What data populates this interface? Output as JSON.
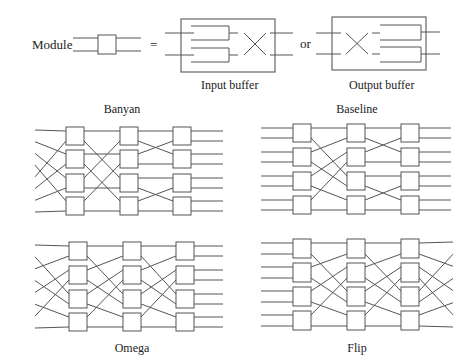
{
  "legend": {
    "module_label": "Module",
    "equals": "=",
    "or": "or",
    "input_buffer_label": "Input buffer",
    "output_buffer_label": "Output buffer"
  },
  "networks": [
    {
      "id": "banyan",
      "title": "Banyan",
      "title_pos": [
        122,
        113
      ],
      "stage_x": [
        66,
        120,
        173
      ],
      "box_w": 18,
      "box_h": 18,
      "rows_y": [
        127,
        150,
        174,
        197
      ],
      "in_x": 35,
      "out_x": 223,
      "inputs": [
        [
          0,
          0
        ],
        [
          1,
          0
        ],
        [
          2,
          0
        ],
        [
          3,
          0
        ],
        [
          0,
          1
        ],
        [
          1,
          1
        ],
        [
          2,
          1
        ],
        [
          3,
          1
        ]
      ],
      "links": [
        [
          [
            0,
            0
          ],
          [
            0,
            0
          ]
        ],
        [
          [
            0,
            1
          ],
          [
            2,
            0
          ]
        ],
        [
          [
            1,
            0
          ],
          [
            1,
            0
          ]
        ],
        [
          [
            1,
            1
          ],
          [
            3,
            0
          ]
        ],
        [
          [
            2,
            0
          ],
          [
            0,
            1
          ]
        ],
        [
          [
            2,
            1
          ],
          [
            2,
            1
          ]
        ],
        [
          [
            3,
            0
          ],
          [
            1,
            1
          ]
        ],
        [
          [
            3,
            1
          ],
          [
            3,
            1
          ]
        ]
      ],
      "links2": [
        [
          [
            0,
            0
          ],
          [
            0,
            0
          ]
        ],
        [
          [
            0,
            1
          ],
          [
            1,
            0
          ]
        ],
        [
          [
            1,
            0
          ],
          [
            0,
            1
          ]
        ],
        [
          [
            1,
            1
          ],
          [
            1,
            1
          ]
        ],
        [
          [
            2,
            0
          ],
          [
            2,
            0
          ]
        ],
        [
          [
            2,
            1
          ],
          [
            3,
            0
          ]
        ],
        [
          [
            3,
            0
          ],
          [
            2,
            1
          ]
        ],
        [
          [
            3,
            1
          ],
          [
            3,
            1
          ]
        ]
      ],
      "output_mode": "parallel"
    },
    {
      "id": "baseline",
      "title": "Baseline",
      "title_pos": [
        357,
        113
      ],
      "stage_x": [
        293,
        347,
        401
      ],
      "box_w": 18,
      "box_h": 18,
      "rows_y": [
        124,
        148,
        172,
        196
      ],
      "in_x": 261,
      "out_x": 451,
      "input_mode": "parallel",
      "links": [
        [
          [
            0,
            0
          ],
          [
            0,
            0
          ]
        ],
        [
          [
            0,
            1
          ],
          [
            2,
            0
          ]
        ],
        [
          [
            1,
            0
          ],
          [
            0,
            1
          ]
        ],
        [
          [
            1,
            1
          ],
          [
            2,
            1
          ]
        ],
        [
          [
            2,
            0
          ],
          [
            1,
            0
          ]
        ],
        [
          [
            2,
            1
          ],
          [
            3,
            0
          ]
        ],
        [
          [
            3,
            0
          ],
          [
            1,
            1
          ]
        ],
        [
          [
            3,
            1
          ],
          [
            3,
            1
          ]
        ]
      ],
      "links2": [
        [
          [
            0,
            0
          ],
          [
            0,
            0
          ]
        ],
        [
          [
            0,
            1
          ],
          [
            1,
            0
          ]
        ],
        [
          [
            1,
            0
          ],
          [
            0,
            1
          ]
        ],
        [
          [
            1,
            1
          ],
          [
            1,
            1
          ]
        ],
        [
          [
            2,
            0
          ],
          [
            2,
            0
          ]
        ],
        [
          [
            2,
            1
          ],
          [
            3,
            0
          ]
        ],
        [
          [
            3,
            0
          ],
          [
            2,
            1
          ]
        ],
        [
          [
            3,
            1
          ],
          [
            3,
            1
          ]
        ]
      ],
      "output_mode": "parallel"
    },
    {
      "id": "omega",
      "title": "Omega",
      "title_pos": [
        132,
        352
      ],
      "stage_x": [
        69,
        123,
        176
      ],
      "box_w": 18,
      "box_h": 18,
      "rows_y": [
        242,
        266,
        290,
        313
      ],
      "in_x": 35,
      "out_x": 223,
      "inputs": [
        [
          0,
          0
        ],
        [
          2,
          0
        ],
        [
          0,
          1
        ],
        [
          2,
          1
        ],
        [
          1,
          0
        ],
        [
          3,
          0
        ],
        [
          1,
          1
        ],
        [
          3,
          1
        ]
      ],
      "links": [
        [
          [
            0,
            0
          ],
          [
            0,
            0
          ]
        ],
        [
          [
            0,
            1
          ],
          [
            2,
            0
          ]
        ],
        [
          [
            1,
            0
          ],
          [
            0,
            1
          ]
        ],
        [
          [
            1,
            1
          ],
          [
            2,
            1
          ]
        ],
        [
          [
            2,
            0
          ],
          [
            1,
            0
          ]
        ],
        [
          [
            2,
            1
          ],
          [
            3,
            0
          ]
        ],
        [
          [
            3,
            0
          ],
          [
            1,
            1
          ]
        ],
        [
          [
            3,
            1
          ],
          [
            3,
            1
          ]
        ]
      ],
      "links2": [
        [
          [
            0,
            0
          ],
          [
            0,
            0
          ]
        ],
        [
          [
            0,
            1
          ],
          [
            2,
            0
          ]
        ],
        [
          [
            1,
            0
          ],
          [
            0,
            1
          ]
        ],
        [
          [
            1,
            1
          ],
          [
            2,
            1
          ]
        ],
        [
          [
            2,
            0
          ],
          [
            1,
            0
          ]
        ],
        [
          [
            2,
            1
          ],
          [
            3,
            0
          ]
        ],
        [
          [
            3,
            0
          ],
          [
            1,
            1
          ]
        ],
        [
          [
            3,
            1
          ],
          [
            3,
            1
          ]
        ]
      ],
      "output_mode": "parallel"
    },
    {
      "id": "flip",
      "title": "Flip",
      "title_pos": [
        357,
        352
      ],
      "stage_x": [
        293,
        347,
        401
      ],
      "box_w": 18,
      "box_h": 19,
      "rows_y": [
        239,
        263,
        287,
        311
      ],
      "in_x": 261,
      "out_x": 453,
      "input_mode": "parallel",
      "links": [
        [
          [
            0,
            0
          ],
          [
            0,
            0
          ]
        ],
        [
          [
            0,
            1
          ],
          [
            2,
            0
          ]
        ],
        [
          [
            1,
            0
          ],
          [
            0,
            1
          ]
        ],
        [
          [
            1,
            1
          ],
          [
            2,
            1
          ]
        ],
        [
          [
            2,
            0
          ],
          [
            1,
            0
          ]
        ],
        [
          [
            2,
            1
          ],
          [
            3,
            0
          ]
        ],
        [
          [
            3,
            0
          ],
          [
            1,
            1
          ]
        ],
        [
          [
            3,
            1
          ],
          [
            3,
            1
          ]
        ]
      ],
      "links2": [
        [
          [
            0,
            0
          ],
          [
            0,
            0
          ]
        ],
        [
          [
            0,
            1
          ],
          [
            2,
            0
          ]
        ],
        [
          [
            1,
            0
          ],
          [
            0,
            1
          ]
        ],
        [
          [
            1,
            1
          ],
          [
            2,
            1
          ]
        ],
        [
          [
            2,
            0
          ],
          [
            1,
            0
          ]
        ],
        [
          [
            2,
            1
          ],
          [
            3,
            0
          ]
        ],
        [
          [
            3,
            0
          ],
          [
            1,
            1
          ]
        ],
        [
          [
            3,
            1
          ],
          [
            3,
            1
          ]
        ]
      ],
      "outputs": [
        [
          0,
          0
        ],
        [
          2,
          0
        ],
        [
          0,
          1
        ],
        [
          2,
          1
        ],
        [
          1,
          0
        ],
        [
          3,
          0
        ],
        [
          1,
          1
        ],
        [
          3,
          1
        ]
      ],
      "output_mode": "shuffle"
    }
  ]
}
